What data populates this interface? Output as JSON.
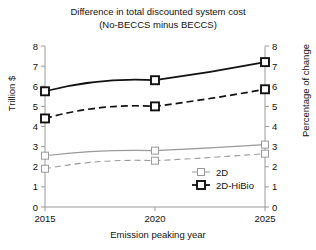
{
  "chart_data": {
    "type": "line",
    "title": "Difference in total discounted system cost",
    "subtitle": "(No-BECCS minus BECCS)",
    "xlabel": "Emission peaking year",
    "ylabel": "Trillion $",
    "ylabel_right": "Percentage of change",
    "x": [
      2015,
      2020,
      2025
    ],
    "xticklabels": [
      "2015",
      "2020",
      "2025"
    ],
    "yticklabels": [
      "0",
      "1",
      "2",
      "3",
      "4",
      "5",
      "6",
      "7",
      "8"
    ],
    "yticklabels_right": [
      "0",
      "1",
      "2",
      "3",
      "4",
      "5",
      "6",
      "7",
      "8"
    ],
    "ylim": [
      0,
      8
    ],
    "ylim_right": [
      0,
      8
    ],
    "xlim": [
      2015,
      2025
    ],
    "grid": false,
    "legend_position": "lower-right",
    "series": [
      {
        "name": "2D-HiBio",
        "unit": "Trillion $",
        "axis": "left",
        "style": "solid",
        "color": "#111111",
        "values": [
          5.75,
          6.3,
          7.2
        ]
      },
      {
        "name": "2D-HiBio",
        "unit": "Percentage of change",
        "axis": "right",
        "style": "dashed",
        "color": "#111111",
        "values": [
          4.4,
          5.0,
          5.85
        ]
      },
      {
        "name": "2D",
        "unit": "Trillion $",
        "axis": "left",
        "style": "solid",
        "color": "#9a9a9a",
        "values": [
          2.55,
          2.8,
          3.1
        ]
      },
      {
        "name": "2D",
        "unit": "Percentage of change",
        "axis": "right",
        "style": "dashed",
        "color": "#9a9a9a",
        "values": [
          1.9,
          2.3,
          2.65
        ]
      }
    ],
    "legend": [
      {
        "label": "2D",
        "color": "#9a9a9a",
        "marker": "square-open",
        "weight": "thin"
      },
      {
        "label": "2D-HiBio",
        "color": "#111111",
        "marker": "square-open",
        "weight": "bold"
      }
    ]
  }
}
